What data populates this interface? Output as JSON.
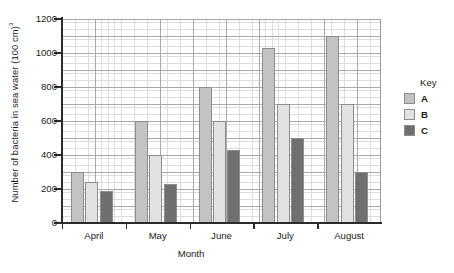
{
  "chart_data": {
    "type": "bar",
    "title": "",
    "xlabel": "Month",
    "ylabel": "Number of bacteria in sea water (100 cm)",
    "ylabel_superscript": "3",
    "categories": [
      "April",
      "May",
      "June",
      "July",
      "August"
    ],
    "series": [
      {
        "name": "A",
        "color": "#c3c3c3",
        "values": [
          300,
          600,
          800,
          1030,
          1100
        ]
      },
      {
        "name": "B",
        "color": "#e2e2e2",
        "values": [
          240,
          400,
          600,
          700,
          700
        ]
      },
      {
        "name": "C",
        "color": "#6f6f6f",
        "values": [
          190,
          230,
          430,
          500,
          300
        ]
      }
    ],
    "ylim": [
      0,
      1200
    ],
    "ytick_values": [
      0,
      200,
      400,
      600,
      800,
      1000,
      1200
    ],
    "ytick_labels": [
      "0",
      "200",
      "400",
      "600",
      "800",
      "1000",
      "1200"
    ],
    "grid": true,
    "grid_minor_step": 20,
    "grid_major_step": 100,
    "legend_position": "right"
  },
  "legend": {
    "title": "Key",
    "entries": [
      {
        "label": "A",
        "color": "#c3c3c3"
      },
      {
        "label": "B",
        "color": "#e2e2e2"
      },
      {
        "label": "C",
        "color": "#6f6f6f"
      }
    ]
  }
}
